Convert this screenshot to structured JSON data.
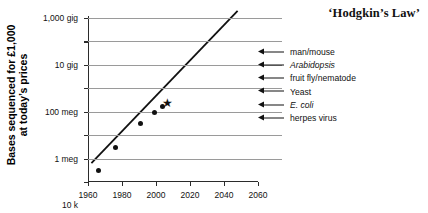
{
  "chart_data": {
    "type": "scatter",
    "title": "‘Hodgkin’s Law’",
    "xlabel": "",
    "ylabel": "Bases sequenced for £1,000 at today’s prices",
    "ylabel_lines": [
      "Bases sequenced for £1,000",
      "at today’s prices"
    ],
    "xlim": [
      1960,
      2060
    ],
    "ylim": [
      0.01,
      1000000000000
    ],
    "yscale": "log",
    "grid": true,
    "legend": "none",
    "xticks": [
      1960,
      1980,
      2000,
      2020,
      2040,
      2060
    ],
    "xtick_labels": [
      "1960",
      "1980",
      "2000",
      "2020",
      "2040",
      "2060"
    ],
    "yticks": [
      0.01,
      1,
      100,
      10000,
      1000000,
      100000000,
      10000000000,
      1000000000000
    ],
    "ytick_labels": [
      "0.01",
      "1",
      "100",
      "10 k",
      "1 meg",
      "100 meg",
      "10 gig",
      "1,000 gig"
    ],
    "series": [
      {
        "name": "observed cost points",
        "marker": "circle",
        "points": [
          {
            "x": 1966,
            "y": 0.1
          },
          {
            "x": 1976,
            "y": 8
          },
          {
            "x": 1991,
            "y": 900
          },
          {
            "x": 1999,
            "y": 9000
          },
          {
            "x": 2004,
            "y": 30000
          }
        ]
      },
      {
        "name": "projected point",
        "marker": "star",
        "points": [
          {
            "x": 2007,
            "y": 60000
          }
        ]
      }
    ],
    "trend": {
      "name": "Hodgkin's Law trend",
      "x_start": 1962,
      "y_start": 0.4,
      "x_end": 2048,
      "y_end": 4000000000000
    },
    "annotations": [
      {
        "label": "man/mouse",
        "italic": false,
        "y_frac": 0.205
      },
      {
        "label": "Arabidopsis",
        "italic": true,
        "y_frac": 0.288
      },
      {
        "label": "fruit fly/nematode",
        "italic": false,
        "y_frac": 0.366
      },
      {
        "label": "Yeast",
        "italic": false,
        "y_frac": 0.447
      },
      {
        "label": "E. coli",
        "italic": true,
        "y_frac": 0.528
      },
      {
        "label": "herpes virus",
        "italic": false,
        "y_frac": 0.609
      }
    ]
  }
}
